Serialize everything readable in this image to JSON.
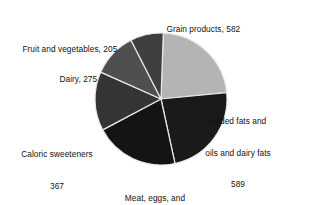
{
  "chart_data": {
    "type": "pie",
    "title": "",
    "subtitle": "",
    "xlabel": "",
    "ylabel": "",
    "legend_position": "none",
    "grid": false,
    "total": 2543,
    "units": "",
    "categories": [
      "Grain products",
      "Added fats and oils and dairy fats",
      "Meat, eggs, and nuts",
      "Caloric sweeteners",
      "Dairy",
      "Fruit and vegetables"
    ],
    "values": [
      582,
      589,
      525,
      367,
      275,
      205
    ],
    "colors": [
      "#b4b4b4",
      "#1a1a1a",
      "#141414",
      "#343434",
      "#4f4f4f",
      "#3f3f3f"
    ],
    "start_angle_deg": 2,
    "slices": [
      {
        "name": "Grain products",
        "value": 582,
        "label_lines": [
          "Grain products, 582"
        ],
        "color": "#b4b4b4",
        "angle_deg": 82.4,
        "percent": 22.9
      },
      {
        "name": "Added fats and oils and dairy fats",
        "value": 589,
        "label_lines": [
          "Added fats and",
          "oils and dairy fats",
          "589"
        ],
        "color": "#1a1a1a",
        "angle_deg": 83.4,
        "percent": 23.2
      },
      {
        "name": "Meat, eggs, and nuts",
        "value": 525,
        "label_lines": [
          "Meat, eggs, and",
          "nuts, 525"
        ],
        "color": "#141414",
        "angle_deg": 74.3,
        "percent": 20.6
      },
      {
        "name": "Caloric sweeteners",
        "value": 367,
        "label_lines": [
          "Caloric sweeteners",
          "367"
        ],
        "color": "#343434",
        "angle_deg": 52.0,
        "percent": 14.4
      },
      {
        "name": "Dairy",
        "value": 275,
        "label_lines": [
          "Dairy, 275"
        ],
        "color": "#4f4f4f",
        "angle_deg": 38.9,
        "percent": 10.8
      },
      {
        "name": "Fruit and vegetables",
        "value": 205,
        "label_lines": [
          "Fruit and vegetables, 205"
        ],
        "color": "#3f3f3f",
        "angle_deg": 29.0,
        "percent": 8.1
      }
    ],
    "geometry": {
      "center_x": 161,
      "center_y": 99,
      "radius": 66,
      "separator_color": "#e8e8e8"
    }
  },
  "labels": {
    "grain": "Grain products, 582",
    "fruit": "Fruit and vegetables, 205",
    "dairy": "Dairy, 275",
    "added_fats_line1": "Added fats and",
    "added_fats_line2": "oils and dairy fats",
    "added_fats_line3": "589",
    "caloric_line1": "Caloric sweeteners",
    "caloric_line2": "367",
    "meat_line1": "Meat, eggs, and",
    "meat_line2": "nuts, 525"
  }
}
